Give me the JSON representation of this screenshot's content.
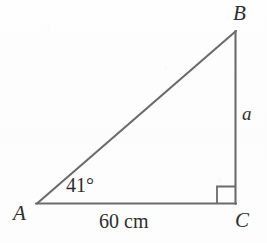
{
  "figure": {
    "kind": "right-triangle-diagram",
    "background_color": "#fdfdfd",
    "stroke_color": "#6b6b6b",
    "text_color": "#2e2e2e"
  },
  "vertices": {
    "a": {
      "label": "A",
      "x": 37,
      "y": 204
    },
    "b": {
      "label": "B",
      "x": 236,
      "y": 31
    },
    "c": {
      "label": "C",
      "x": 235,
      "y": 204
    }
  },
  "sides": {
    "vertical": {
      "label": "a",
      "from": "B",
      "to": "C"
    },
    "base": {
      "label": "60 cm",
      "value": "60",
      "unit": "cm",
      "from": "A",
      "to": "C"
    },
    "hypotenuse": {
      "label": "",
      "from": "A",
      "to": "B"
    }
  },
  "angles": {
    "at_a": {
      "label": "41°",
      "value": "41",
      "unit": "degrees"
    },
    "at_c": {
      "label": "",
      "value": "90",
      "unit": "degrees",
      "marker": "right-angle-square"
    }
  }
}
